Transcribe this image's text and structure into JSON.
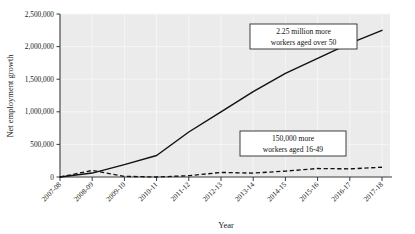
{
  "chart_data": {
    "type": "line",
    "title": "",
    "xlabel": "Year",
    "ylabel": "Net employment growth",
    "categories": [
      "2007-08",
      "2008-09",
      "2009-10",
      "2010-11",
      "2011-12",
      "2012-13",
      "2013-14",
      "2014-15",
      "2015-16",
      "2016-17",
      "2017-18"
    ],
    "ylim": [
      0,
      2500000
    ],
    "ytick_labels": [
      "0",
      "500,000",
      "1,000,000",
      "1,500,000",
      "2,000,000",
      "2,500,000"
    ],
    "ytick_values": [
      0,
      500000,
      1000000,
      1500000,
      2000000,
      2500000
    ],
    "grid": true,
    "legend_position": "none",
    "series": [
      {
        "name": "Workers aged over 50",
        "style": "solid",
        "values": [
          0,
          60000,
          190000,
          330000,
          690000,
          1000000,
          1310000,
          1590000,
          1820000,
          2050000,
          2250000
        ]
      },
      {
        "name": "Workers aged 16-49",
        "style": "dashed",
        "values": [
          0,
          100000,
          10000,
          0,
          20000,
          70000,
          60000,
          90000,
          130000,
          125000,
          150000
        ]
      }
    ],
    "annotations": [
      {
        "id": "annotation-over-50",
        "line1": "2.25 million more",
        "line2": "workers aged over 50"
      },
      {
        "id": "annotation-16-49",
        "line1": "150,000 more",
        "line2": "workers aged 16-49"
      }
    ]
  },
  "colors": {
    "plot_background": "#ebebeb",
    "line": "#111111",
    "axis": "#3a3a3a",
    "gridline": "#f7f7f7",
    "page_background": "#ffffff"
  }
}
